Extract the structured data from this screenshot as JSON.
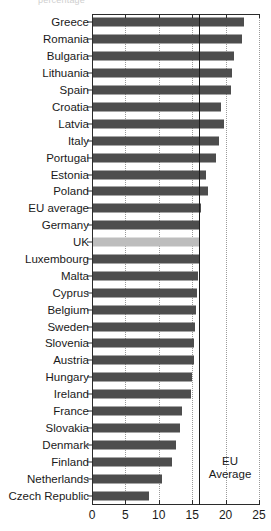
{
  "top_crop_remnant": "percentage",
  "chart_data": {
    "type": "bar",
    "orientation": "horizontal",
    "title": "",
    "xlabel": "",
    "ylabel": "",
    "xlim": [
      0,
      25
    ],
    "xticks": [
      0,
      5,
      10,
      15,
      20,
      25
    ],
    "xtick_labels": [
      "0",
      "5",
      "10",
      "15",
      "20",
      "25"
    ],
    "grid": "dotted vertical gridlines at 5, 10, 15, 20, 25",
    "legend": "none",
    "bar_color": "#4d4d4d",
    "highlight_color": "#bdbdbd",
    "highlight_category": "UK",
    "annotation": {
      "label_line1": "EU",
      "label_line2": "Average",
      "value": 16,
      "line_color": "#1c1c1c"
    },
    "categories": [
      "Greece",
      "Romania",
      "Bulgaria",
      "Lithuania",
      "Spain",
      "Croatia",
      "Latvia",
      "Italy",
      "Portugal",
      "Estonia",
      "Poland",
      "EU average",
      "Germany",
      "UK",
      "Luxembourg",
      "Malta",
      "Cyprus",
      "Belgium",
      "Sweden",
      "Slovenia",
      "Austria",
      "Hungary",
      "Ireland",
      "France",
      "Slovakia",
      "Denmark",
      "Finland",
      "Netherlands",
      "Czech Republic"
    ],
    "values": [
      22.8,
      22.5,
      21.3,
      21.0,
      20.8,
      19.3,
      19.7,
      19.0,
      18.5,
      17.1,
      17.3,
      16.3,
      16.2,
      16.0,
      16.0,
      15.9,
      15.7,
      15.6,
      15.4,
      15.3,
      15.2,
      15.0,
      14.8,
      13.5,
      13.2,
      12.5,
      12.0,
      10.5,
      8.5
    ]
  }
}
